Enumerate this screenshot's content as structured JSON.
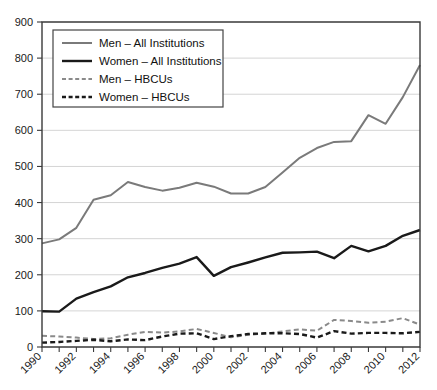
{
  "chart_data": {
    "type": "line",
    "title": "",
    "xlabel": "",
    "ylabel": "",
    "xlim": [
      1990,
      2012
    ],
    "ylim": [
      0,
      900
    ],
    "grid": true,
    "legend_position": "top-left",
    "x": [
      1990,
      1991,
      1992,
      1993,
      1994,
      1995,
      1996,
      1997,
      1998,
      1999,
      2000,
      2001,
      2002,
      2003,
      2004,
      2005,
      2006,
      2007,
      2008,
      2009,
      2010,
      2011,
      2012
    ],
    "xtick_labels": [
      "1990",
      "1992",
      "1994",
      "1996",
      "1998",
      "2000",
      "2002",
      "2004",
      "2006",
      "2008",
      "2010",
      "2012"
    ],
    "ytick_labels": [
      "0",
      "100",
      "200",
      "300",
      "400",
      "500",
      "600",
      "700",
      "800",
      "900"
    ],
    "ytick_values": [
      0,
      100,
      200,
      300,
      400,
      500,
      600,
      700,
      800,
      900
    ],
    "series": [
      {
        "name": "Men – All Institutions",
        "color": "#7a7a7a",
        "style": "solid",
        "width": 2.0,
        "values": [
          287,
          298,
          330,
          408,
          420,
          457,
          443,
          433,
          441,
          455,
          444,
          425,
          425,
          443,
          483,
          524,
          551,
          568,
          570,
          642,
          618,
          692,
          781
        ]
      },
      {
        "name": "Women – All Institutions",
        "color": "#1a1a1a",
        "style": "solid",
        "width": 2.4,
        "values": [
          99,
          98,
          134,
          152,
          168,
          193,
          205,
          219,
          231,
          249,
          197,
          221,
          234,
          248,
          261,
          262,
          264,
          246,
          280,
          265,
          280,
          308,
          324
        ]
      },
      {
        "name": "Men – HBCUs",
        "color": "#8a8a8a",
        "style": "dashed",
        "width": 2.0,
        "values": [
          31,
          29,
          26,
          22,
          24,
          34,
          42,
          40,
          43,
          50,
          39,
          27,
          34,
          37,
          43,
          49,
          45,
          75,
          72,
          67,
          70,
          80,
          62
        ]
      },
      {
        "name": "Women – HBCUs",
        "color": "#1a1a1a",
        "style": "dashed",
        "width": 2.4,
        "values": [
          12,
          14,
          17,
          20,
          16,
          21,
          19,
          29,
          37,
          38,
          22,
          30,
          36,
          38,
          38,
          36,
          26,
          44,
          37,
          39,
          39,
          38,
          42
        ]
      }
    ]
  },
  "legend": {
    "items": [
      {
        "label": "Men – All Institutions"
      },
      {
        "label": "Women – All Institutions"
      },
      {
        "label": "Men – HBCUs"
      },
      {
        "label": "Women – HBCUs"
      }
    ]
  }
}
